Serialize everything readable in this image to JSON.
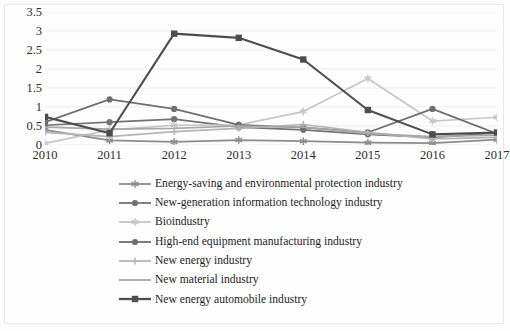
{
  "chart_data": {
    "type": "line",
    "title": "",
    "xlabel": "",
    "ylabel": "",
    "categories": [
      "2010",
      "2011",
      "2012",
      "2013",
      "2014",
      "2015",
      "2016",
      "2017"
    ],
    "x": [
      2010,
      2011,
      2012,
      2013,
      2014,
      2015,
      2016,
      2017
    ],
    "ylim": [
      0,
      3.5
    ],
    "yticks": [
      "0",
      "0.5",
      "1",
      "1.5",
      "2",
      "2.5",
      "3",
      "3.5"
    ],
    "ytick_values": [
      0,
      0.5,
      1,
      1.5,
      2,
      2.5,
      3,
      3.5
    ],
    "grid": true,
    "grid_axis": "y",
    "legend_position": "bottom",
    "series": [
      {
        "name": "Energy-saving and environmental protection industry",
        "color": "#8c8c8c",
        "marker": "asterisk",
        "values": [
          0.4,
          0.12,
          0.08,
          0.13,
          0.1,
          0.06,
          0.05,
          0.14
        ]
      },
      {
        "name": "New-generation information technology industry",
        "color": "#737373",
        "marker": "circle",
        "values": [
          0.52,
          0.6,
          0.68,
          0.47,
          0.4,
          0.28,
          0.2,
          0.32
        ]
      },
      {
        "name": "Bioindustry",
        "color": "#c6c6c6",
        "marker": "star",
        "values": [
          0.04,
          0.4,
          0.52,
          0.53,
          0.88,
          1.75,
          0.63,
          0.73
        ]
      },
      {
        "name": "High-end equipment manufacturing industry",
        "color": "#6e6e6e",
        "marker": "circle",
        "values": [
          0.6,
          1.2,
          0.95,
          0.53,
          0.46,
          0.33,
          0.95,
          0.3
        ]
      },
      {
        "name": "New energy industry",
        "color": "#b5b5b5",
        "marker": "plus",
        "values": [
          0.33,
          0.22,
          0.35,
          0.44,
          0.54,
          0.33,
          0.16,
          0.2
        ]
      },
      {
        "name": "New material industry",
        "color": "#a8a8a8",
        "marker": "none",
        "values": [
          0.47,
          0.42,
          0.44,
          0.5,
          0.47,
          0.3,
          0.22,
          0.26
        ]
      },
      {
        "name": "New energy automobile industry",
        "color": "#4d4d4d",
        "marker": "square",
        "values": [
          0.74,
          0.31,
          2.93,
          2.82,
          2.25,
          0.92,
          0.28,
          0.33
        ]
      }
    ]
  },
  "legend": {
    "items": [
      {
        "label": "Energy-saving and environmental protection industry"
      },
      {
        "label": "New-generation information technology industry"
      },
      {
        "label": "Bioindustry"
      },
      {
        "label": "High-end equipment manufacturing industry"
      },
      {
        "label": "New energy industry"
      },
      {
        "label": "New material industry"
      },
      {
        "label": "New energy automobile industry"
      }
    ]
  }
}
